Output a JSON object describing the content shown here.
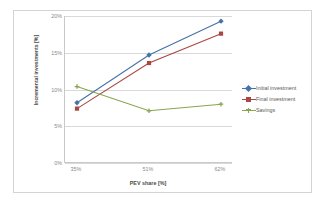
{
  "chart_data": {
    "type": "line",
    "title": "",
    "xlabel": "PEV share [%]",
    "ylabel": "Incremental investments [%]",
    "categories": [
      "35%",
      "51%",
      "62%"
    ],
    "x_values": [
      35,
      51,
      62
    ],
    "ylim": [
      0,
      20
    ],
    "y_ticks": [
      "0%",
      "5%",
      "10%",
      "15%",
      "20%"
    ],
    "y_tick_values": [
      0,
      5,
      10,
      15,
      20
    ],
    "grid": true,
    "legend_position": "right",
    "series": [
      {
        "name": "Initial investment",
        "color": "#4572a7",
        "marker": "diamond",
        "values": [
          8.2,
          14.7,
          19.3
        ]
      },
      {
        "name": "Final investment",
        "color": "#aa4643",
        "marker": "square",
        "values": [
          7.4,
          13.6,
          17.6
        ]
      },
      {
        "name": "Savings",
        "color": "#89a54e",
        "marker": "cross",
        "values": [
          10.4,
          7.1,
          8.0
        ]
      }
    ]
  },
  "legend": {
    "items": [
      {
        "label": "Initial investment"
      },
      {
        "label": "Final investment"
      },
      {
        "label": "Savings"
      }
    ]
  },
  "axes": {
    "y_title": "Incremental investments [%]",
    "x_title": "PEV share [%]",
    "y_tick_labels": [
      "20%",
      "15%",
      "10%",
      "5%",
      "0%"
    ],
    "x_tick_labels": [
      "35%",
      "51%",
      "62%"
    ]
  },
  "colors": {
    "series_initial": "#4572a7",
    "series_final": "#aa4643",
    "series_savings": "#89a54e",
    "grid": "#d9d9d9",
    "axis": "#c9c9c9",
    "frame": "#d4d4d4",
    "tick_text": "#8a8a8a",
    "title_text": "#4a4a4a"
  }
}
